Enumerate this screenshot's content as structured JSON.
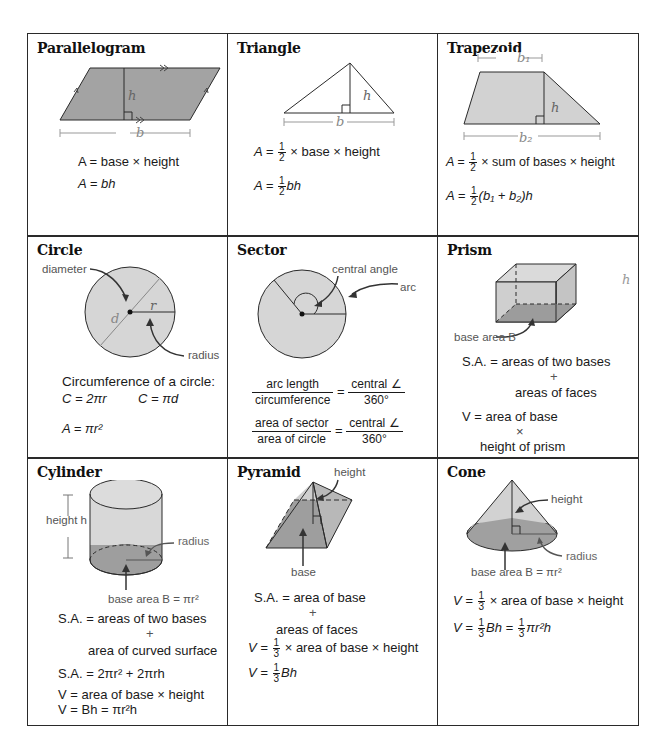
{
  "cells": {
    "parallelogram": {
      "title": "Parallelogram",
      "labels": {
        "h": "h",
        "b": "b"
      },
      "formulas": [
        "A = base × height",
        "A = bh"
      ]
    },
    "triangle": {
      "title": "Triangle",
      "labels": {
        "h": "h",
        "b": "b"
      },
      "formulas": [
        "A = 1/2 × base × height",
        "A = 1/2 bh"
      ],
      "f1_lead": "A =",
      "f1_tail": "× base × height",
      "f2_lead": "A =",
      "f2_tail": "bh",
      "half_num": "1",
      "half_den": "2"
    },
    "trapezoid": {
      "title": "Trapezoid",
      "labels": {
        "b1": "b₁",
        "b2": "b₂",
        "h": "h"
      },
      "formulas": [
        "A = 1/2 × sum of bases × height",
        "A = 1/2(b1 + b2)h"
      ],
      "f1_lead": "A =",
      "f1_tail": "× sum of bases × height",
      "f2_lead": "A =",
      "f2_tail": "(b₁ + b₂)h",
      "half_num": "1",
      "half_den": "2"
    },
    "circle": {
      "title": "Circle",
      "labels": {
        "diameter": "diameter",
        "radius": "radius",
        "d": "d",
        "r": "r"
      },
      "circumference_heading": "Circumference of a circle:",
      "formulas": [
        "C = 2πr",
        "C = πd",
        "A = πr²"
      ]
    },
    "sector": {
      "title": "Sector",
      "labels": {
        "central_angle": "central angle",
        "arc": "arc"
      },
      "ratio1": {
        "left_num": "arc length",
        "left_den": "circumference",
        "right_num": "central ∠",
        "right_den": "360°"
      },
      "ratio2": {
        "left_num": "area of sector",
        "left_den": "area of circle",
        "right_num": "central ∠",
        "right_den": "360°"
      },
      "equals": "="
    },
    "prism": {
      "title": "Prism",
      "labels": {
        "h": "h",
        "base_area": "base area B"
      },
      "sa_line1": "S.A. = areas of two bases",
      "sa_plus": "+",
      "sa_line2": "areas of faces",
      "v_line1": "V = area of base",
      "v_times": "×",
      "v_line2": "height of prism"
    },
    "cylinder": {
      "title": "Cylinder",
      "labels": {
        "height": "height h",
        "radius": "radius",
        "base_area": "base area B = πr²"
      },
      "sa_line1": "S.A. = areas of two bases",
      "sa_plus": "+",
      "sa_line2": "area of curved surface",
      "sa_formula": "S.A. = 2πr² + 2πrh",
      "v_line1": "V = area of base × height",
      "v_line2": "V = Bh = πr²h"
    },
    "pyramid": {
      "title": "Pyramid",
      "labels": {
        "height": "height",
        "base": "base"
      },
      "sa_line1": "S.A. = area of base",
      "sa_plus": "+",
      "sa_line2": "areas of faces",
      "v1_lead": "V =",
      "v1_tail": "× area of base × height",
      "v2_lead": "V =",
      "v2_tail": "Bh",
      "third_num": "1",
      "third_den": "3"
    },
    "cone": {
      "title": "Cone",
      "labels": {
        "height": "height",
        "radius": "radius",
        "base_area": "base area B = πr²"
      },
      "v1_lead": "V =",
      "v1_tail": "× area of base × height",
      "v2_lead": "V =",
      "v2_mid": "Bh =",
      "v2_tail": "πr²h",
      "third_num": "1",
      "third_den": "3"
    }
  },
  "colors": {
    "fill_light": "#d4d4d4",
    "fill_dark": "#9a9a9a",
    "line": "#2a2a2a",
    "label_gray": "#666666"
  }
}
